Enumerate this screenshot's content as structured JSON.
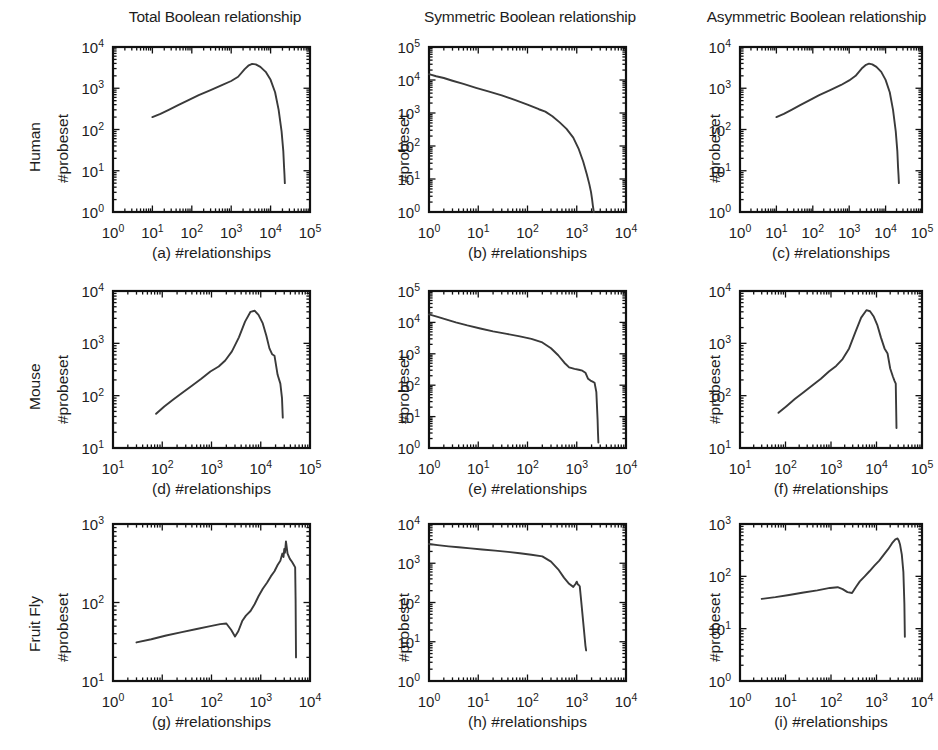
{
  "figure": {
    "background": "#ffffff",
    "line_color": "#3a3a3a",
    "axis_color": "#111111",
    "columns": [
      {
        "id": "total",
        "title": "Total Boolean relationship"
      },
      {
        "id": "symmetric",
        "title": "Symmetric Boolean relationship"
      },
      {
        "id": "asymmetric",
        "title": "Asymmetric Boolean relationship"
      }
    ],
    "rows": [
      {
        "id": "human",
        "label": "Human"
      },
      {
        "id": "mouse",
        "label": "Mouse"
      },
      {
        "id": "fruitfly",
        "label": "Fruit Fly"
      }
    ],
    "shared_y_label": "#probeset",
    "shared_x_label": "#relationships"
  },
  "chart_data": [
    {
      "id": "a",
      "type": "line",
      "panel_letter": "(a)",
      "caption": "(a) #relationships",
      "row": "Human",
      "column": "Total Boolean relationship",
      "title": "Total Boolean relationship",
      "xlabel": "#relationships",
      "ylabel": "#probeset",
      "xscale": "log",
      "yscale": "log",
      "xlim": [
        1,
        100000
      ],
      "ylim": [
        1,
        10000
      ],
      "xticks": [
        1,
        10,
        100,
        1000,
        10000,
        100000
      ],
      "xtick_labels": [
        "10^0",
        "10^1",
        "10^2",
        "10^3",
        "10^4",
        "10^5"
      ],
      "yticks": [
        1,
        10,
        100,
        1000,
        10000
      ],
      "ytick_labels": [
        "10^0",
        "10^1",
        "10^2",
        "10^3",
        "10^4"
      ],
      "grid": false,
      "legend": null,
      "x": [
        10,
        16,
        26,
        45,
        80,
        150,
        300,
        600,
        1000,
        1500,
        2200,
        2800,
        3400,
        4200,
        5500,
        7500,
        10000,
        13000,
        16000,
        19000,
        21000,
        22000,
        22500,
        23000
      ],
      "y": [
        200,
        240,
        300,
        390,
        510,
        680,
        900,
        1200,
        1500,
        1900,
        2900,
        3600,
        3900,
        3800,
        3300,
        2500,
        1600,
        800,
        300,
        90,
        30,
        12,
        8,
        5
      ]
    },
    {
      "id": "b",
      "type": "line",
      "panel_letter": "(b)",
      "caption": "(b) #relationships",
      "row": "Human",
      "column": "Symmetric Boolean relationship",
      "title": "Symmetric Boolean relationship",
      "xlabel": "#relationships",
      "ylabel": "#probeset",
      "xscale": "log",
      "yscale": "log",
      "xlim": [
        1,
        10000
      ],
      "ylim": [
        1,
        100000
      ],
      "xticks": [
        1,
        10,
        100,
        1000,
        10000
      ],
      "xtick_labels": [
        "10^0",
        "10^1",
        "10^2",
        "10^3",
        "10^4"
      ],
      "yticks": [
        1,
        10,
        100,
        1000,
        10000,
        100000
      ],
      "ytick_labels": [
        "10^0",
        "10^1",
        "10^2",
        "10^3",
        "10^4",
        "10^5"
      ],
      "grid": false,
      "legend": null,
      "x": [
        1,
        1.4,
        2,
        3,
        5,
        9,
        16,
        30,
        55,
        100,
        170,
        230,
        320,
        450,
        620,
        850,
        1100,
        1350,
        1600,
        1800,
        1950,
        2050,
        2120,
        2180,
        2220
      ],
      "y": [
        15000,
        13000,
        11500,
        9500,
        7600,
        5800,
        4500,
        3400,
        2500,
        1800,
        1300,
        1100,
        800,
        520,
        330,
        180,
        80,
        34,
        14,
        7,
        4,
        2.4,
        1.6,
        1.2,
        1
      ]
    },
    {
      "id": "c",
      "type": "line",
      "panel_letter": "(c)",
      "caption": "(c) #relationships",
      "row": "Human",
      "column": "Asymmetric Boolean relationship",
      "title": "Asymmetric Boolean relationship",
      "xlabel": "#relationships",
      "ylabel": "#probeset",
      "xscale": "log",
      "yscale": "log",
      "xlim": [
        1,
        100000
      ],
      "ylim": [
        1,
        10000
      ],
      "xticks": [
        1,
        10,
        100,
        1000,
        10000,
        100000
      ],
      "xtick_labels": [
        "10^0",
        "10^1",
        "10^2",
        "10^3",
        "10^4",
        "10^5"
      ],
      "yticks": [
        1,
        10,
        100,
        1000,
        10000
      ],
      "ytick_labels": [
        "10^0",
        "10^1",
        "10^2",
        "10^3",
        "10^4"
      ],
      "grid": false,
      "legend": null,
      "x": [
        10,
        16,
        26,
        45,
        80,
        150,
        300,
        600,
        1000,
        1500,
        2200,
        2900,
        3500,
        4300,
        5600,
        7600,
        10000,
        13000,
        16000,
        19000,
        21000,
        22000,
        22600,
        23200
      ],
      "y": [
        200,
        240,
        300,
        390,
        510,
        680,
        900,
        1200,
        1550,
        2000,
        3000,
        3700,
        3950,
        3800,
        3300,
        2500,
        1600,
        800,
        300,
        90,
        30,
        12,
        8,
        5
      ]
    },
    {
      "id": "d",
      "type": "line",
      "panel_letter": "(d)",
      "caption": "(d) #relationships",
      "row": "Mouse",
      "column": "Total Boolean relationship",
      "title": "Total Boolean relationship",
      "xlabel": "#relationships",
      "ylabel": "#probeset",
      "xscale": "log",
      "yscale": "log",
      "xlim": [
        10,
        100000
      ],
      "ylim": [
        10,
        10000
      ],
      "xticks": [
        10,
        100,
        1000,
        10000,
        100000
      ],
      "xtick_labels": [
        "10^1",
        "10^2",
        "10^3",
        "10^4",
        "10^5"
      ],
      "yticks": [
        10,
        100,
        1000,
        10000
      ],
      "ytick_labels": [
        "10^1",
        "10^2",
        "10^3",
        "10^4"
      ],
      "grid": false,
      "legend": null,
      "x": [
        75,
        110,
        170,
        260,
        400,
        620,
        950,
        1400,
        1900,
        2600,
        3600,
        4800,
        6200,
        7500,
        9000,
        11000,
        13000,
        15000,
        17000,
        19000,
        22000,
        25000,
        27000,
        28000
      ],
      "y": [
        45,
        62,
        85,
        115,
        155,
        210,
        290,
        360,
        470,
        700,
        1300,
        2600,
        4000,
        4200,
        3500,
        2400,
        1400,
        800,
        620,
        580,
        250,
        170,
        90,
        38
      ]
    },
    {
      "id": "e",
      "type": "line",
      "panel_letter": "(e)",
      "caption": "(e) #relationships",
      "row": "Mouse",
      "column": "Symmetric Boolean relationship",
      "title": "Symmetric Boolean relationship",
      "xlabel": "#relationships",
      "ylabel": "#probeset",
      "xscale": "log",
      "yscale": "log",
      "xlim": [
        1,
        10000
      ],
      "ylim": [
        1,
        100000
      ],
      "xticks": [
        1,
        10,
        100,
        1000,
        10000
      ],
      "xtick_labels": [
        "10^0",
        "10^1",
        "10^2",
        "10^3",
        "10^4"
      ],
      "yticks": [
        1,
        10,
        100,
        1000,
        10000,
        100000
      ],
      "ytick_labels": [
        "10^0",
        "10^1",
        "10^2",
        "10^3",
        "10^4",
        "10^5"
      ],
      "grid": false,
      "legend": null,
      "x": [
        1,
        1.5,
        2.2,
        3.5,
        6,
        11,
        20,
        38,
        70,
        120,
        200,
        300,
        420,
        560,
        700,
        900,
        1100,
        1300,
        1500,
        1700,
        1900,
        2100,
        2300,
        2500,
        2650,
        2700,
        2750
      ],
      "y": [
        18000,
        15000,
        12500,
        10000,
        8000,
        6400,
        5200,
        4300,
        3600,
        3000,
        2300,
        1500,
        900,
        520,
        370,
        330,
        310,
        290,
        250,
        160,
        140,
        130,
        120,
        60,
        8,
        3,
        1.5
      ]
    },
    {
      "id": "f",
      "type": "line",
      "panel_letter": "(f)",
      "caption": "(f) #relationships",
      "row": "Mouse",
      "column": "Asymmetric Boolean relationship",
      "title": "Asymmetric Boolean relationship",
      "xlabel": "#relationships",
      "ylabel": "#probeset",
      "xscale": "log",
      "yscale": "log",
      "xlim": [
        10,
        100000
      ],
      "ylim": [
        10,
        10000
      ],
      "xticks": [
        10,
        100,
        1000,
        10000,
        100000
      ],
      "xtick_labels": [
        "10^1",
        "10^2",
        "10^3",
        "10^4",
        "10^5"
      ],
      "yticks": [
        10,
        100,
        1000,
        10000
      ],
      "ytick_labels": [
        "10^1",
        "10^2",
        "10^3",
        "10^4"
      ],
      "grid": false,
      "legend": null,
      "x": [
        70,
        105,
        160,
        250,
        380,
        600,
        900,
        1300,
        1800,
        2500,
        3400,
        4600,
        6000,
        7200,
        8600,
        10500,
        12500,
        15000,
        17500,
        20000,
        23000,
        25000,
        26500,
        27500
      ],
      "y": [
        47,
        63,
        86,
        116,
        155,
        210,
        290,
        370,
        500,
        800,
        1600,
        3100,
        4300,
        4100,
        3300,
        2200,
        1300,
        800,
        640,
        330,
        230,
        190,
        170,
        24
      ]
    },
    {
      "id": "g",
      "type": "line",
      "panel_letter": "(g)",
      "caption": "(g) #relationships",
      "row": "Fruit Fly",
      "column": "Total Boolean relationship",
      "title": "Total Boolean relationship",
      "xlabel": "#relationships",
      "ylabel": "#probeset",
      "xscale": "log",
      "yscale": "log",
      "xlim": [
        1,
        10000
      ],
      "ylim": [
        10,
        1000
      ],
      "xticks": [
        1,
        10,
        100,
        1000,
        10000
      ],
      "xtick_labels": [
        "10^0",
        "10^1",
        "10^2",
        "10^3",
        "10^4"
      ],
      "yticks": [
        10,
        100,
        1000
      ],
      "ytick_labels": [
        "10^1",
        "10^2",
        "10^3"
      ],
      "grid": false,
      "legend": null,
      "x": [
        3,
        6,
        12,
        25,
        50,
        95,
        150,
        200,
        250,
        300,
        350,
        420,
        500,
        620,
        750,
        900,
        1100,
        1350,
        1600,
        1900,
        2200,
        2500,
        2750,
        2900,
        3000,
        3100,
        3250,
        3500,
        3900,
        4300,
        4700,
        5000,
        5100,
        5200
      ],
      "y": [
        31,
        34,
        38,
        42,
        46,
        50,
        53,
        54,
        45,
        37,
        43,
        58,
        68,
        78,
        95,
        120,
        150,
        180,
        215,
        250,
        300,
        340,
        420,
        380,
        480,
        430,
        600,
        420,
        360,
        330,
        300,
        280,
        110,
        20
      ]
    },
    {
      "id": "h",
      "type": "line",
      "panel_letter": "(h)",
      "caption": "(h) #relationships",
      "row": "Fruit Fly",
      "column": "Symmetric Boolean relationship",
      "title": "Symmetric Boolean relationship",
      "xlabel": "#relationships",
      "ylabel": "#probeset",
      "xscale": "log",
      "yscale": "log",
      "xlim": [
        1,
        10000
      ],
      "ylim": [
        1,
        10000
      ],
      "xticks": [
        1,
        10,
        100,
        1000,
        10000
      ],
      "xtick_labels": [
        "10^0",
        "10^1",
        "10^2",
        "10^3",
        "10^4"
      ],
      "yticks": [
        1,
        10,
        100,
        1000,
        10000
      ],
      "ytick_labels": [
        "10^0",
        "10^1",
        "10^2",
        "10^3",
        "10^4"
      ],
      "grid": false,
      "legend": null,
      "x": [
        1,
        1.5,
        2.5,
        4,
        7,
        12,
        22,
        40,
        70,
        120,
        200,
        300,
        420,
        550,
        700,
        850,
        950,
        1000,
        1050,
        1100,
        1150,
        1250,
        1400,
        1500,
        1550
      ],
      "y": [
        3100,
        2900,
        2700,
        2550,
        2400,
        2250,
        2100,
        1950,
        1800,
        1650,
        1500,
        1100,
        700,
        430,
        300,
        250,
        300,
        340,
        290,
        280,
        260,
        90,
        20,
        8,
        6
      ]
    },
    {
      "id": "i",
      "type": "line",
      "panel_letter": "(i)",
      "caption": "(i) #relationships",
      "row": "Fruit Fly",
      "column": "Asymmetric Boolean relationship",
      "title": "Asymmetric Boolean relationship",
      "xlabel": "#relationships",
      "ylabel": "#probeset",
      "xscale": "log",
      "yscale": "log",
      "xlim": [
        1,
        10000
      ],
      "ylim": [
        1,
        1000
      ],
      "xticks": [
        1,
        10,
        100,
        1000,
        10000
      ],
      "xtick_labels": [
        "10^0",
        "10^1",
        "10^2",
        "10^3",
        "10^4"
      ],
      "yticks": [
        1,
        10,
        100,
        1000
      ],
      "ytick_labels": [
        "10^0",
        "10^1",
        "10^2",
        "10^3"
      ],
      "grid": false,
      "legend": null,
      "x": [
        3,
        6,
        12,
        25,
        50,
        95,
        140,
        180,
        230,
        290,
        350,
        430,
        550,
        700,
        900,
        1150,
        1450,
        1800,
        2200,
        2600,
        2900,
        3100,
        3300,
        3600,
        3900,
        4100,
        4200
      ],
      "y": [
        37,
        40,
        44,
        49,
        54,
        60,
        62,
        57,
        50,
        48,
        62,
        80,
        100,
        125,
        160,
        200,
        260,
        330,
        430,
        510,
        530,
        480,
        400,
        260,
        120,
        30,
        7
      ]
    }
  ],
  "panel_layout": [
    {
      "id": "a",
      "left": 113,
      "top": 47,
      "width": 197,
      "height": 165
    },
    {
      "id": "b",
      "left": 429,
      "top": 47,
      "width": 197,
      "height": 165
    },
    {
      "id": "c",
      "left": 740,
      "top": 47,
      "width": 182,
      "height": 165
    },
    {
      "id": "d",
      "left": 113,
      "top": 291,
      "width": 197,
      "height": 157
    },
    {
      "id": "e",
      "left": 429,
      "top": 291,
      "width": 197,
      "height": 157
    },
    {
      "id": "f",
      "left": 740,
      "top": 291,
      "width": 182,
      "height": 157
    },
    {
      "id": "g",
      "left": 113,
      "top": 524,
      "width": 197,
      "height": 157
    },
    {
      "id": "h",
      "left": 429,
      "top": 524,
      "width": 197,
      "height": 157
    },
    {
      "id": "i",
      "left": 740,
      "top": 524,
      "width": 182,
      "height": 157
    }
  ],
  "column_title_layout": [
    {
      "id": "total",
      "left": 100,
      "top": 8,
      "width": 230
    },
    {
      "id": "symmetric",
      "left": 405,
      "top": 8,
      "width": 250
    },
    {
      "id": "asymmetric",
      "left": 700,
      "top": 8,
      "width": 233
    }
  ],
  "row_label_layout": [
    {
      "id": "human",
      "left": 26,
      "top": 172
    },
    {
      "id": "mouse",
      "left": 26,
      "top": 410
    },
    {
      "id": "fruitfly",
      "left": 26,
      "top": 652
    }
  ],
  "ylabel_layout": [
    {
      "panel": "a",
      "left": 54,
      "top": 183
    },
    {
      "panel": "b",
      "left": 395,
      "top": 183
    },
    {
      "panel": "c",
      "left": 706,
      "top": 183
    },
    {
      "panel": "d",
      "left": 54,
      "top": 424
    },
    {
      "panel": "e",
      "left": 395,
      "top": 424
    },
    {
      "panel": "f",
      "left": 706,
      "top": 424
    },
    {
      "panel": "g",
      "left": 54,
      "top": 662
    },
    {
      "panel": "h",
      "left": 395,
      "top": 662
    },
    {
      "panel": "i",
      "left": 706,
      "top": 662
    }
  ],
  "caption_layout": [
    {
      "panel": "a",
      "left": 113,
      "top": 244,
      "width": 197
    },
    {
      "panel": "b",
      "left": 429,
      "top": 244,
      "width": 197
    },
    {
      "panel": "c",
      "left": 740,
      "top": 244,
      "width": 182
    },
    {
      "panel": "d",
      "left": 113,
      "top": 480,
      "width": 197
    },
    {
      "panel": "e",
      "left": 429,
      "top": 480,
      "width": 197
    },
    {
      "panel": "f",
      "left": 740,
      "top": 480,
      "width": 182
    },
    {
      "panel": "g",
      "left": 113,
      "top": 713,
      "width": 197
    },
    {
      "panel": "h",
      "left": 429,
      "top": 713,
      "width": 197
    },
    {
      "panel": "i",
      "left": 740,
      "top": 713,
      "width": 182
    }
  ]
}
